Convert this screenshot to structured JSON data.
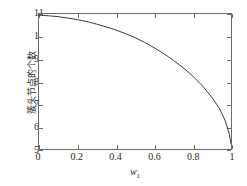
{
  "chart_data": {
    "type": "line",
    "title": "",
    "xlabel": "w1",
    "xlabel_base": "w",
    "xlabel_sub": "1",
    "ylabel": "簇头节点的个数",
    "xlim": [
      0,
      1
    ],
    "ylim": [
      5,
      11
    ],
    "grid": false,
    "legend": null,
    "xticks": [
      "0",
      "0.2",
      "0.4",
      "0.6",
      "0.8",
      "1"
    ],
    "xtick_values": [
      0,
      0.2,
      0.4,
      0.6,
      0.8,
      1
    ],
    "yticks": [
      "5",
      "6",
      "7",
      "8",
      "9",
      "10",
      "11"
    ],
    "ytick_values": [
      5,
      6,
      7,
      8,
      9,
      10,
      11
    ],
    "series": [
      {
        "name": "cluster-head-count",
        "color": "#3d3d3d",
        "x": [
          0.0,
          0.05,
          0.1,
          0.15,
          0.2,
          0.25,
          0.3,
          0.35,
          0.4,
          0.45,
          0.5,
          0.55,
          0.6,
          0.65,
          0.7,
          0.75,
          0.8,
          0.85,
          0.9,
          0.94,
          0.97,
          0.99,
          1.0
        ],
        "values": [
          10.95,
          10.92,
          10.88,
          10.82,
          10.75,
          10.66,
          10.55,
          10.43,
          10.29,
          10.13,
          9.95,
          9.74,
          9.5,
          9.24,
          8.94,
          8.62,
          8.25,
          7.82,
          7.3,
          6.8,
          6.25,
          5.7,
          5.22
        ]
      }
    ]
  }
}
